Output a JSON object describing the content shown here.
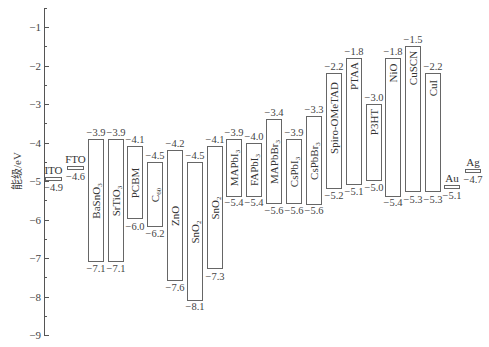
{
  "chart_data": {
    "type": "bar",
    "subtype": "energy-level-diagram (floating bars: CBM/LUMO top, VBM/HOMO bottom)",
    "title": "",
    "xlabel": "",
    "ylabel": "能级/eV",
    "ylim": [
      -9,
      -0.5
    ],
    "yticks": [
      -1,
      -2,
      -3,
      -4,
      -5,
      -6,
      -7,
      -8,
      -9
    ],
    "grid": false,
    "legend": null,
    "categories": [
      "ITO",
      "FTO",
      "BaSnO3",
      "SrTiO3",
      "PCBM",
      "C60",
      "ZnO",
      "SnO2",
      "SnO2",
      "MAPbI3",
      "FAPbI3",
      "MAPbBr3",
      "CsPbI3",
      "CsPbBr3",
      "Spiro-OMeTAD",
      "PTAA",
      "P3HT",
      "NiO",
      "CuSCN",
      "CuI",
      "Au",
      "Ag"
    ],
    "series": [
      {
        "name": "Upper level (CB / LUMO / work function)",
        "values": [
          -4.9,
          -4.6,
          -3.9,
          -3.9,
          -4.1,
          -4.5,
          -4.2,
          -4.5,
          -4.1,
          -3.9,
          -4.0,
          -3.4,
          -3.9,
          -3.3,
          -2.2,
          -1.8,
          -3.0,
          -1.8,
          -1.5,
          -2.2,
          -5.1,
          -4.7
        ]
      },
      {
        "name": "Lower level (VB / HOMO)",
        "values": [
          null,
          null,
          -7.1,
          -7.1,
          -6.0,
          -6.2,
          -7.6,
          -8.1,
          -7.3,
          -5.4,
          -5.4,
          -5.6,
          -5.6,
          -5.6,
          -5.2,
          -5.1,
          -5.0,
          -5.4,
          -5.3,
          -5.3,
          null,
          null
        ]
      }
    ]
  },
  "axis": {
    "label": "能级/eV",
    "ticks": [
      {
        "v": -1,
        "label": "−1"
      },
      {
        "v": -2,
        "label": "−2"
      },
      {
        "v": -3,
        "label": "−3"
      },
      {
        "v": -4,
        "label": "−4"
      },
      {
        "v": -5,
        "label": "−5"
      },
      {
        "v": -6,
        "label": "−6"
      },
      {
        "v": -7,
        "label": "−7"
      },
      {
        "v": -8,
        "label": "−8"
      },
      {
        "v": -9,
        "label": "−9"
      }
    ]
  },
  "bars": [
    {
      "id": "ito",
      "name": "ITO",
      "sub": "",
      "x": 45,
      "w": 17,
      "top": -4.9,
      "bottom": null,
      "top_label": "",
      "bottom_label": "−4.9",
      "name_pos": "above-left"
    },
    {
      "id": "fto",
      "name": "FTO",
      "sub": "",
      "x": 67,
      "w": 17,
      "top": -4.6,
      "bottom": null,
      "top_label": "",
      "bottom_label": "−4.6",
      "name_pos": "above"
    },
    {
      "id": "basno3",
      "name": "BaSnO",
      "sub": "3",
      "x": 88,
      "w": 16,
      "top": -3.9,
      "bottom": -7.1,
      "top_label": "−3.9",
      "bottom_label": "−7.1",
      "name_pos": "inside"
    },
    {
      "id": "srtio3",
      "name": "SrTiO",
      "sub": "3",
      "x": 108,
      "w": 16,
      "top": -3.9,
      "bottom": -7.1,
      "top_label": "−3.9",
      "bottom_label": "−7.1",
      "name_pos": "inside"
    },
    {
      "id": "pcbm",
      "name": "PCBM",
      "sub": "",
      "x": 127,
      "w": 16,
      "top": -4.1,
      "bottom": -6.0,
      "top_label": "−4.1",
      "bottom_label": "−6.0",
      "name_pos": "inside"
    },
    {
      "id": "c60",
      "name": "C",
      "sub": "60",
      "x": 147,
      "w": 16,
      "top": -4.5,
      "bottom": -6.2,
      "top_label": "−4.5",
      "bottom_label": "−6.2",
      "name_pos": "inside"
    },
    {
      "id": "zno",
      "name": "ZnO",
      "sub": "",
      "x": 167,
      "w": 16,
      "top": -4.2,
      "bottom": -7.6,
      "top_label": "−4.2",
      "bottom_label": "−7.6",
      "name_pos": "inside"
    },
    {
      "id": "sno2-a",
      "name": "SnO",
      "sub": "2",
      "x": 187,
      "w": 16,
      "top": -4.5,
      "bottom": -8.1,
      "top_label": "−4.5",
      "bottom_label": "−8.1",
      "name_pos": "inside"
    },
    {
      "id": "sno2-b",
      "name": "SnO",
      "sub": "2",
      "x": 207,
      "w": 16,
      "top": -4.1,
      "bottom": -7.3,
      "top_label": "−4.1",
      "bottom_label": "−7.3",
      "name_pos": "inside"
    },
    {
      "id": "mapbi3",
      "name": "MAPbI",
      "sub": "3",
      "x": 226,
      "w": 16,
      "top": -3.9,
      "bottom": -5.4,
      "top_label": "−3.9",
      "bottom_label": "−5.4",
      "name_pos": "inside"
    },
    {
      "id": "fapbi3",
      "name": "FAPbI",
      "sub": "3",
      "x": 246,
      "w": 16,
      "top": -4.0,
      "bottom": -5.4,
      "top_label": "−4.0",
      "bottom_label": "−5.4",
      "name_pos": "inside"
    },
    {
      "id": "mapbbr3",
      "name": "MAPbBr",
      "sub": "3",
      "x": 266,
      "w": 16,
      "top": -3.4,
      "bottom": -5.6,
      "top_label": "−3.4",
      "bottom_label": "−5.6",
      "name_pos": "inside"
    },
    {
      "id": "cspbi3",
      "name": "CsPbI",
      "sub": "3",
      "x": 286,
      "w": 16,
      "top": -3.9,
      "bottom": -5.6,
      "top_label": "−3.9",
      "bottom_label": "−5.6",
      "name_pos": "inside"
    },
    {
      "id": "cspbbr3",
      "name": "CsPbBr",
      "sub": "3",
      "x": 306,
      "w": 16,
      "top": -3.3,
      "bottom": -5.6,
      "top_label": "−3.3",
      "bottom_label": "−5.6",
      "name_pos": "inside"
    },
    {
      "id": "spiro",
      "name": "Spiro-OMeTAD",
      "sub": "",
      "x": 326,
      "w": 16,
      "top": -2.2,
      "bottom": -5.2,
      "top_label": "−2.2",
      "bottom_label": "−5.2",
      "name_pos": "inside-top"
    },
    {
      "id": "ptaa",
      "name": "PTAA",
      "sub": "",
      "x": 346,
      "w": 16,
      "top": -1.8,
      "bottom": -5.1,
      "top_label": "−1.8",
      "bottom_label": "−5.1",
      "name_pos": "inside-top"
    },
    {
      "id": "p3ht",
      "name": "P3HT",
      "sub": "",
      "x": 366,
      "w": 16,
      "top": -3.0,
      "bottom": -5.0,
      "top_label": "−3.0",
      "bottom_label": "−5.0",
      "name_pos": "inside-top"
    },
    {
      "id": "nio",
      "name": "NiO",
      "sub": "",
      "x": 385,
      "w": 16,
      "top": -1.8,
      "bottom": -5.4,
      "top_label": "−1.8",
      "bottom_label": "−5.4",
      "name_pos": "inside-top"
    },
    {
      "id": "cuscn",
      "name": "CuSCN",
      "sub": "",
      "x": 405,
      "w": 16,
      "top": -1.5,
      "bottom": -5.3,
      "top_label": "−1.5",
      "bottom_label": "−5.3",
      "name_pos": "inside-top"
    },
    {
      "id": "cui",
      "name": "CuI",
      "sub": "",
      "x": 425,
      "w": 16,
      "top": -2.2,
      "bottom": -5.3,
      "top_label": "−2.2",
      "bottom_label": "−5.3",
      "name_pos": "inside-top"
    },
    {
      "id": "au",
      "name": "Au",
      "sub": "",
      "x": 444,
      "w": 16,
      "top": -5.1,
      "bottom": null,
      "top_label": "",
      "bottom_label": "−5.1",
      "name_pos": "above"
    },
    {
      "id": "ag",
      "name": "Ag",
      "sub": "",
      "x": 465,
      "w": 16,
      "top": -4.7,
      "bottom": null,
      "top_label": "",
      "bottom_label": "−4.7",
      "name_pos": "above"
    }
  ]
}
